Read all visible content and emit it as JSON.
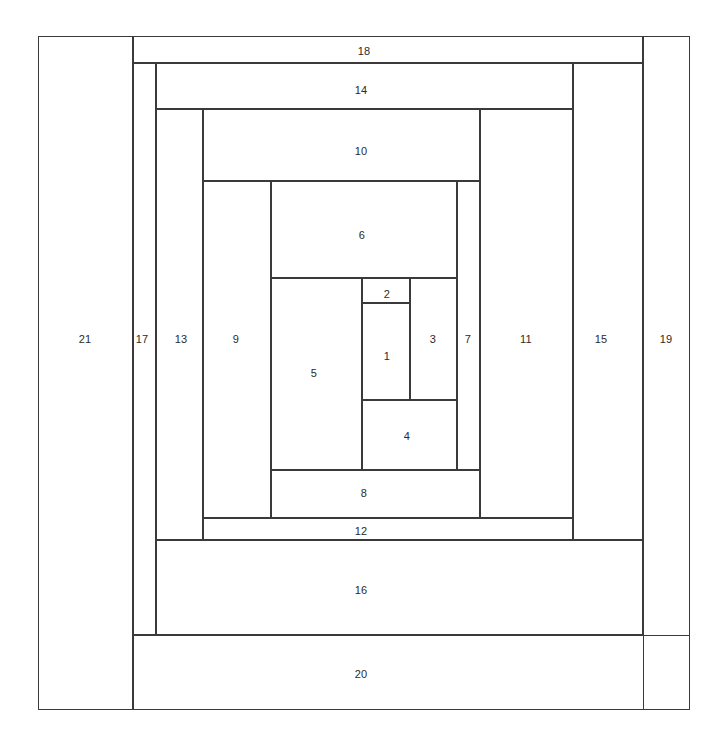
{
  "diagram": {
    "kind": "spiral-rectangle-subdivision",
    "title": "",
    "canvas": {
      "width": 723,
      "height": 748
    },
    "style": {
      "stroke_color": "#3a3a3a",
      "stroke_width_px": 1,
      "fill_color": "#ffffff",
      "background_color": "#ffffff",
      "label_color": "#2b2b2b",
      "label_font_size_px": 11
    },
    "cells": [
      {
        "label": "1",
        "x": 362,
        "y": 303,
        "w": 48,
        "h": 97,
        "label_x": 386,
        "label_y": 355
      },
      {
        "label": "2",
        "x": 362,
        "y": 278,
        "w": 48,
        "h": 25,
        "label_x": 386,
        "label_y": 293
      },
      {
        "label": "3",
        "x": 410,
        "y": 278,
        "w": 47,
        "h": 122,
        "label_x": 432,
        "label_y": 338
      },
      {
        "label": "4",
        "x": 362,
        "y": 400,
        "w": 95,
        "h": 70,
        "label_x": 406,
        "label_y": 435
      },
      {
        "label": "5",
        "x": 271,
        "y": 278,
        "w": 91,
        "h": 192,
        "label_x": 313,
        "label_y": 372
      },
      {
        "label": "6",
        "x": 271,
        "y": 181,
        "w": 186,
        "h": 97,
        "label_x": 361,
        "label_y": 234
      },
      {
        "label": "7",
        "x": 457,
        "y": 181,
        "w": 23,
        "h": 289,
        "label_x": 467,
        "label_y": 338
      },
      {
        "label": "8",
        "x": 271,
        "y": 470,
        "w": 209,
        "h": 48,
        "label_x": 363,
        "label_y": 492
      },
      {
        "label": "9",
        "x": 203,
        "y": 181,
        "w": 68,
        "h": 337,
        "label_x": 235,
        "label_y": 338
      },
      {
        "label": "10",
        "x": 203,
        "y": 109,
        "w": 277,
        "h": 72,
        "label_x": 360,
        "label_y": 150
      },
      {
        "label": "11",
        "x": 480,
        "y": 109,
        "w": 93,
        "h": 409,
        "label_x": 525,
        "label_y": 338
      },
      {
        "label": "12",
        "x": 203,
        "y": 518,
        "w": 370,
        "h": 22,
        "label_x": 360,
        "label_y": 530
      },
      {
        "label": "13",
        "x": 156,
        "y": 109,
        "w": 47,
        "h": 431,
        "label_x": 180,
        "label_y": 338
      },
      {
        "label": "14",
        "x": 156,
        "y": 63,
        "w": 417,
        "h": 46,
        "label_x": 360,
        "label_y": 89
      },
      {
        "label": "15",
        "x": 573,
        "y": 63,
        "w": 70,
        "h": 477,
        "label_x": 600,
        "label_y": 338
      },
      {
        "label": "16",
        "x": 156,
        "y": 540,
        "w": 487,
        "h": 95,
        "label_x": 360,
        "label_y": 589
      },
      {
        "label": "17",
        "x": 133,
        "y": 63,
        "w": 23,
        "h": 572,
        "label_x": 141,
        "label_y": 338
      },
      {
        "label": "18",
        "x": 133,
        "y": 36,
        "w": 510,
        "h": 27,
        "label_x": 363,
        "label_y": 50
      },
      {
        "label": "19",
        "x": 643,
        "y": 36,
        "w": 47,
        "h": 674,
        "label_x": 665,
        "label_y": 338
      },
      {
        "label": "20",
        "x": 133,
        "y": 635,
        "w": 557,
        "h": 75,
        "label_x": 360,
        "label_y": 673
      },
      {
        "label": "21",
        "x": 38,
        "y": 36,
        "w": 95,
        "h": 674,
        "label_x": 84,
        "label_y": 338
      }
    ]
  }
}
